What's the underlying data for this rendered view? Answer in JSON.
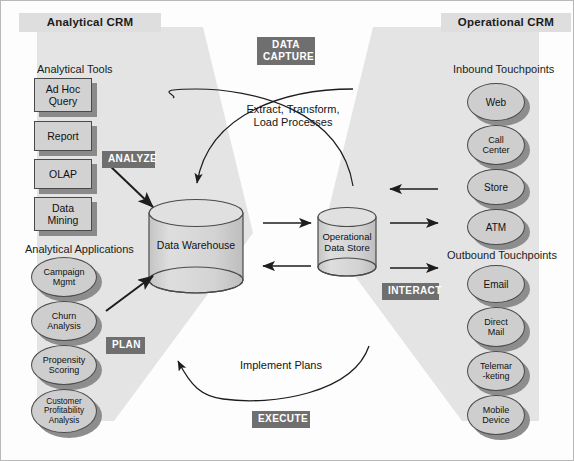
{
  "diagram": {
    "title_left": "Analytical CRM",
    "title_right": "Operational CRM"
  },
  "sections": {
    "analytical_tools": "Analytical Tools",
    "analytical_applications": "Analytical Applications",
    "inbound_touchpoints": "Inbound Touchpoints",
    "outbound_touchpoints": "Outbound Touchpoints"
  },
  "analytical_tools": [
    {
      "label": "Ad Hoc Query",
      "line1": "Ad Hoc",
      "line2": "Query"
    },
    {
      "label": "Report",
      "line1": "Report",
      "line2": ""
    },
    {
      "label": "OLAP",
      "line1": "OLAP",
      "line2": ""
    },
    {
      "label": "Data Mining",
      "line1": "Data",
      "line2": "Mining"
    }
  ],
  "analytical_applications": [
    {
      "label": "Campaign Mgmt",
      "line1": "Campaign",
      "line2": "Mgmt",
      "line3": ""
    },
    {
      "label": "Churn Analysis",
      "line1": "Churn",
      "line2": "Analysis",
      "line3": ""
    },
    {
      "label": "Propensity Scoring",
      "line1": "Propensity",
      "line2": "Scoring",
      "line3": ""
    },
    {
      "label": "Customer Profitability Analysis",
      "line1": "Customer",
      "line2": "Profitability",
      "line3": "Analysis"
    }
  ],
  "inbound_touchpoints": [
    {
      "label": "Web",
      "line1": "Web",
      "line2": ""
    },
    {
      "label": "Call Center",
      "line1": "Call",
      "line2": "Center"
    },
    {
      "label": "Store",
      "line1": "Store",
      "line2": ""
    },
    {
      "label": "ATM",
      "line1": "ATM",
      "line2": ""
    }
  ],
  "outbound_touchpoints": [
    {
      "label": "Email",
      "line1": "Email",
      "line2": ""
    },
    {
      "label": "Direct Mail",
      "line1": "Direct",
      "line2": "Mail"
    },
    {
      "label": "Telemarketing",
      "line1": "Telemar",
      "line2": "-keting"
    },
    {
      "label": "Mobile Device",
      "line1": "Mobile",
      "line2": "Device"
    }
  ],
  "datastores": {
    "warehouse": "Data Warehouse",
    "ods_line1": "Operational",
    "ods_line2": "Data Store"
  },
  "process_labels": {
    "data_capture_line1": "Data",
    "data_capture_line2": "Capture",
    "analyze": "Analyze",
    "plan": "Plan",
    "interact": "Interact",
    "execute": "Execute"
  },
  "flow_labels": {
    "etl_line1": "Extract, Transform,",
    "etl_line2": "Load Processes",
    "implement": "Implement Plans"
  },
  "colors": {
    "wedge": "#e4e4e4",
    "banner": "#dedede",
    "process_label_bg": "#6f6f6f",
    "shape_fill": "#d2d2d2",
    "shadow": "#8a8a8a",
    "stroke": "#4a4a4a"
  }
}
